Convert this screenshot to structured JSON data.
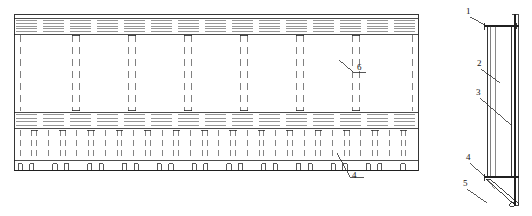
{
  "drawing": {
    "type": "engineering-elevation-and-section",
    "background": "#ffffff",
    "line_color": "#1f1f1f",
    "thin_line_color": "#555555",
    "views": [
      {
        "name": "elevation-view",
        "position": "left",
        "x": 14,
        "y": 14,
        "width": 404,
        "height": 156,
        "bands": [
          {
            "name": "top-hatch-band",
            "y": 18,
            "height": 16,
            "kind": "hatched"
          },
          {
            "name": "upper-open-panel",
            "y": 34,
            "height": 78,
            "kind": "open"
          },
          {
            "name": "middle-hatch-band",
            "y": 112,
            "height": 16,
            "kind": "hatched"
          },
          {
            "name": "lower-panel",
            "y": 128,
            "height": 42,
            "kind": "studded"
          },
          {
            "name": "bottom-castellated-edge",
            "y": 160,
            "height": 10,
            "kind": "crenellated"
          }
        ]
      },
      {
        "name": "section-detail-view",
        "position": "right",
        "x": 462,
        "y": 18,
        "width": 62,
        "height": 188
      }
    ],
    "callouts": [
      {
        "id": "1",
        "label": "1",
        "view": "section-detail-view",
        "text_x": 466,
        "text_y": 14,
        "leader": "M470,17 L487,26 L498,26"
      },
      {
        "id": "2",
        "label": "2",
        "view": "section-detail-view",
        "text_x": 477,
        "text_y": 66,
        "leader": "M481,69 L500,83"
      },
      {
        "id": "3",
        "label": "3",
        "view": "section-detail-view",
        "text_x": 476,
        "text_y": 95,
        "leader": "M480,98 L511,125"
      },
      {
        "id": "4",
        "label": "4",
        "view": "section-detail-view",
        "text_x": 466,
        "text_y": 160,
        "leader": "M470,163 L485,177"
      },
      {
        "id": "5",
        "label": "5",
        "view": "section-detail-view",
        "text_x": 463,
        "text_y": 186,
        "leader": "M467,189 L487,203"
      },
      {
        "id": "6",
        "label": "6",
        "view": "elevation-view",
        "text_x": 357,
        "text_y": 70,
        "leader": "M339,60 L353,72 L366,72"
      },
      {
        "id": "4b",
        "label": "4",
        "view": "elevation-view",
        "text_x": 352,
        "text_y": 178,
        "leader": "M337,153 L350,177 L364,177"
      }
    ]
  }
}
